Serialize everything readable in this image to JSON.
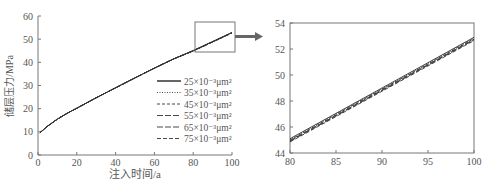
{
  "chart_data": [
    {
      "type": "line",
      "title": "",
      "xlabel": "注入时间/a",
      "ylabel": "储层压力/MPa",
      "xlim": [
        0,
        100
      ],
      "ylim": [
        0,
        60
      ],
      "xticks": [
        0,
        20,
        40,
        60,
        80,
        100
      ],
      "yticks": [
        0,
        10,
        20,
        30,
        40,
        50,
        60
      ],
      "grid": false,
      "legend_position": "center-right",
      "x": [
        1,
        5,
        10,
        15,
        20,
        30,
        40,
        50,
        60,
        70,
        80,
        90,
        100
      ],
      "series": [
        {
          "name": "25×10⁻³μm²",
          "style": "solid",
          "values": [
            9.6,
            12.5,
            15.5,
            18.0,
            20.2,
            24.7,
            29.0,
            33.3,
            37.5,
            41.5,
            45.1,
            49.0,
            52.9
          ]
        },
        {
          "name": "35×10⁻³μm²",
          "style": "dotted",
          "values": [
            9.6,
            12.5,
            15.5,
            18.0,
            20.2,
            24.7,
            29.0,
            33.3,
            37.5,
            41.5,
            45.05,
            48.95,
            52.85
          ]
        },
        {
          "name": "45×10⁻³μm²",
          "style": "dashed",
          "values": [
            9.6,
            12.5,
            15.5,
            18.0,
            20.2,
            24.7,
            29.0,
            33.3,
            37.5,
            41.5,
            45.0,
            48.9,
            52.8
          ]
        },
        {
          "name": "55×10⁻³μm²",
          "style": "long-dash",
          "values": [
            9.6,
            12.5,
            15.5,
            18.0,
            20.2,
            24.7,
            29.0,
            33.3,
            37.5,
            41.5,
            44.95,
            48.85,
            52.75
          ]
        },
        {
          "name": "65×10⁻³μm²",
          "style": "long-dash",
          "values": [
            9.6,
            12.5,
            15.5,
            18.0,
            20.2,
            24.7,
            29.0,
            33.3,
            37.5,
            41.5,
            44.9,
            48.8,
            52.7
          ]
        },
        {
          "name": "75×10⁻³μm²",
          "style": "dash",
          "values": [
            9.6,
            12.5,
            15.5,
            18.0,
            20.2,
            24.7,
            29.0,
            33.3,
            37.5,
            41.5,
            44.85,
            48.75,
            52.65
          ]
        }
      ],
      "annotations": [
        "zoom box over x 80–100, y 45–57 with arrow to inset"
      ]
    },
    {
      "type": "line",
      "title": "",
      "xlabel": "",
      "ylabel": "",
      "xlim": [
        80,
        100
      ],
      "ylim": [
        44,
        54
      ],
      "xticks": [
        80,
        85,
        90,
        95,
        100
      ],
      "yticks": [
        44,
        46,
        48,
        50,
        52,
        54
      ],
      "grid": false,
      "x": [
        80,
        100
      ],
      "series": [
        {
          "name": "25×10⁻³μm²",
          "values": [
            45.1,
            52.9
          ]
        },
        {
          "name": "35×10⁻³μm²",
          "values": [
            45.05,
            52.85
          ]
        },
        {
          "name": "45×10⁻³μm²",
          "values": [
            45.0,
            52.8
          ]
        },
        {
          "name": "55×10⁻³μm²",
          "values": [
            44.95,
            52.75
          ]
        },
        {
          "name": "65×10⁻³μm²",
          "values": [
            44.9,
            52.7
          ]
        },
        {
          "name": "75×10⁻³μm²",
          "values": [
            44.85,
            52.65
          ]
        }
      ]
    }
  ],
  "colors": {
    "axis": "#777777",
    "line": "#333333",
    "arrow": "#666666"
  }
}
